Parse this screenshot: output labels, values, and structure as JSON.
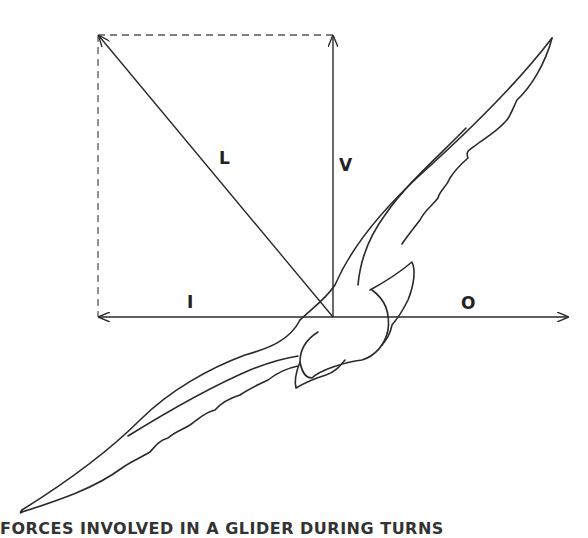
{
  "diagram": {
    "vectors": [
      {
        "id": "L",
        "label": "L",
        "meaning": "resultant",
        "from": [
          333,
          317
        ],
        "to": [
          98,
          35
        ]
      },
      {
        "id": "V",
        "label": "V",
        "meaning": "vertical component",
        "from": [
          333,
          317
        ],
        "to": [
          333,
          35
        ]
      },
      {
        "id": "I",
        "label": "I",
        "meaning": "horizontal component (left)",
        "from": [
          333,
          317
        ],
        "to": [
          98,
          317
        ]
      },
      {
        "id": "O",
        "label": "O",
        "meaning": "horizontal component (right)",
        "from": [
          333,
          317
        ],
        "to": [
          568,
          317
        ]
      }
    ],
    "labels": {
      "L": "L",
      "V": "V",
      "I": "I",
      "O": "O"
    },
    "parallelogram": {
      "style": "dashed",
      "corners": [
        [
          98,
          35
        ],
        [
          333,
          35
        ],
        [
          333,
          317
        ],
        [
          98,
          317
        ]
      ]
    },
    "caption": "FORCES INVOLVED IN A GLIDER DURING TURNS",
    "colors": {
      "line": "#2a2a2a",
      "background": "#ffffff",
      "dash": "#555555"
    }
  }
}
